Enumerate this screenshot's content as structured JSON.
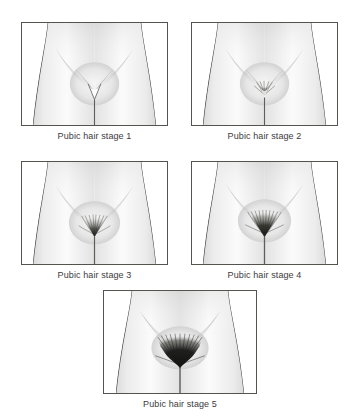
{
  "figure": {
    "background_color": "#ffffff",
    "frame_border_color": "#54544f",
    "caption_color": "#3b3b3b",
    "skin_light": "#fdfdfd",
    "skin_mid": "#d8d8d8",
    "skin_shadow": "#a9a9a9",
    "outline_color": "#4a4a46",
    "hair_color": "#2b2b28"
  },
  "panels": [
    {
      "id": "stage-1",
      "caption": "Pubic hair stage 1",
      "stage_number": "1",
      "hair_description": "no pubic hair",
      "hair_density": 0,
      "hair_width": 0,
      "hair_height": 0,
      "left": 21,
      "top": 22,
      "width": 147,
      "height": 104
    },
    {
      "id": "stage-2",
      "caption": "Pubic hair stage 2",
      "stage_number": "2",
      "hair_description": "sparse, long, slightly pigmented hair along labia",
      "hair_density": 1,
      "hair_width": 16,
      "hair_height": 13,
      "left": 191,
      "top": 22,
      "width": 147,
      "height": 104
    },
    {
      "id": "stage-3",
      "caption": "Pubic hair stage 3",
      "stage_number": "3",
      "hair_description": "darker, coarser, curlier hair spreading sparsely over junction of pubes",
      "hair_density": 2,
      "hair_width": 26,
      "hair_height": 16,
      "left": 21,
      "top": 161,
      "width": 147,
      "height": 104
    },
    {
      "id": "stage-4",
      "caption": "Pubic hair stage 4",
      "stage_number": "4",
      "hair_description": "adult-type hair covering a smaller area than adult, no spread to thighs",
      "hair_density": 3,
      "hair_width": 34,
      "hair_height": 19,
      "left": 191,
      "top": 161,
      "width": 147,
      "height": 104
    },
    {
      "id": "stage-5",
      "caption": "Pubic hair stage 5",
      "stage_number": "5",
      "hair_description": "adult in quantity and type, inverse triangle distribution",
      "hair_density": 4,
      "hair_width": 46,
      "hair_height": 25,
      "left": 103,
      "top": 290,
      "width": 154,
      "height": 104
    }
  ]
}
